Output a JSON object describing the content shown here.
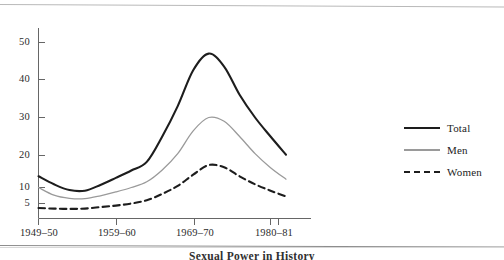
{
  "chart_data": {
    "type": "line",
    "title": "",
    "subtitle": "",
    "xlabel": "",
    "ylabel": "",
    "grid": false,
    "legend_position": "right",
    "x_tick_labels": [
      "1949–50",
      "1959–60",
      "1969–70",
      "1980–81"
    ],
    "y_tick_labels": [
      "5",
      "10",
      "20",
      "30",
      "40",
      "50"
    ],
    "y_tick_values": [
      5,
      10,
      20,
      30,
      40,
      50
    ],
    "ylim": [
      0,
      55
    ],
    "x": [
      "1949-50",
      "1951-52",
      "1953-54",
      "1955-56",
      "1957-58",
      "1959-60",
      "1961-62",
      "1963-64",
      "1965-66",
      "1967-68",
      "1969-70",
      "1970-71",
      "1972-73",
      "1974-75",
      "1976-77",
      "1978-79",
      "1980-81"
    ],
    "series": [
      {
        "name": "Total",
        "style": "solid",
        "color": "#1d1d1d",
        "width": 2.1,
        "values": [
          13.5,
          11.0,
          9.2,
          9.0,
          10.8,
          13.0,
          15.3,
          18.0,
          25.0,
          33.0,
          42.5,
          47.0,
          43.5,
          36.0,
          30.0,
          25.0,
          20.2
        ]
      },
      {
        "name": "Men",
        "style": "solid",
        "color": "#9a9a9a",
        "width": 1.3,
        "values": [
          10.0,
          7.6,
          6.6,
          6.5,
          7.4,
          8.6,
          10.0,
          11.8,
          15.5,
          20.5,
          26.5,
          30.0,
          29.0,
          25.0,
          20.5,
          16.2,
          12.6
        ]
      },
      {
        "name": "Women",
        "style": "dashed",
        "color": "#1d1d1d",
        "width": 2.1,
        "values": [
          3.5,
          3.3,
          3.2,
          3.3,
          3.8,
          4.3,
          5.0,
          6.0,
          8.0,
          10.5,
          14.0,
          17.0,
          16.3,
          13.5,
          11.0,
          9.0,
          7.2
        ]
      }
    ],
    "annotations": {
      "double_tick_near": "1980–81"
    }
  },
  "legend": {
    "items": [
      {
        "label": "Total",
        "swatch": "solid-black-thick"
      },
      {
        "label": "Men",
        "swatch": "solid-gray-thin"
      },
      {
        "label": "Women",
        "swatch": "dashed-black"
      }
    ]
  },
  "caption": {
    "text": "Sexual Power in History"
  },
  "colors": {
    "total": "#1d1d1d",
    "men": "#9a9a9a",
    "women": "#1d1d1d",
    "axis": "#555555",
    "text": "#2b2b2b",
    "rule": "#8d8d8d",
    "background": "#ffffff"
  }
}
